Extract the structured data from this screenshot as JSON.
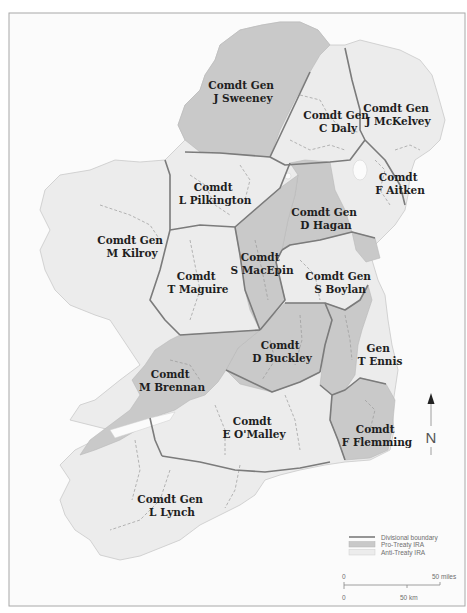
{
  "map": {
    "colors": {
      "pro_treaty": "#c9c9c9",
      "anti_treaty": "#ececec",
      "boundary": "#7b7b7b",
      "sea": "#fbfbfb"
    },
    "regions": [
      {
        "rank": "Comdt Gen",
        "name": "J Sweeney",
        "side": "Pro-Treaty"
      },
      {
        "rank": "Comdt Gen",
        "name": "C Daly",
        "side": "Anti-Treaty"
      },
      {
        "rank": "Comdt Gen",
        "name": "J McKelvey",
        "side": "Anti-Treaty"
      },
      {
        "rank": "Comdt",
        "name": "F Aitken",
        "side": "Anti-Treaty"
      },
      {
        "rank": "Comdt",
        "name": "L Pilkington",
        "side": "Anti-Treaty"
      },
      {
        "rank": "Comdt Gen",
        "name": "D Hagan",
        "side": "Pro-Treaty"
      },
      {
        "rank": "Comdt Gen",
        "name": "M Kilroy",
        "side": "Anti-Treaty"
      },
      {
        "rank": "Comdt",
        "name": "S MacEpin",
        "side": "Pro-Treaty"
      },
      {
        "rank": "Comdt",
        "name": "T Maguire",
        "side": "Anti-Treaty"
      },
      {
        "rank": "Comdt Gen",
        "name": "S Boylan",
        "side": "Anti-Treaty"
      },
      {
        "rank": "Comdt",
        "name": "D Buckley",
        "side": "Pro-Treaty"
      },
      {
        "rank": "Gen",
        "name": "T Ennis",
        "side": "Pro-Treaty"
      },
      {
        "rank": "Comdt",
        "name": "M Brennan",
        "side": "Pro-Treaty"
      },
      {
        "rank": "Comdt",
        "name": "E O'Malley",
        "side": "Anti-Treaty"
      },
      {
        "rank": "Comdt",
        "name": "F Flemming",
        "side": "Pro-Treaty"
      },
      {
        "rank": "Comdt Gen",
        "name": "L Lynch",
        "side": "Anti-Treaty"
      }
    ]
  },
  "legend": {
    "items": [
      {
        "label": "Divisional boundary",
        "symbol": "line"
      },
      {
        "label": "Pro-Treaty IRA",
        "symbol": "swatch-dark"
      },
      {
        "label": "Anti-Treaty IRA",
        "symbol": "swatch-light"
      }
    ]
  },
  "scale": {
    "miles_zero": "0",
    "miles_label": "50 miles",
    "km_zero": "0",
    "km_label": "50 km"
  },
  "north": {
    "label": "N",
    "icon": "north-arrow-icon"
  }
}
